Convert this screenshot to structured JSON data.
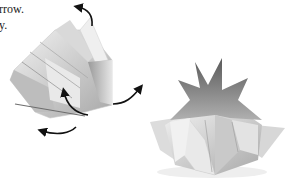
{
  "caption": {
    "lines": [
      "rrow.",
      "y."
    ]
  },
  "figures": {
    "left": {
      "description": "partially folded origami model with rotation arrows",
      "arrow_count": 4
    },
    "right": {
      "description": "completed eight-pointed star origami vase"
    }
  },
  "colors": {
    "background": "#ffffff",
    "text": "#1a1a1a",
    "arrow": "#111111",
    "paper_light": "#e8e8e8",
    "paper_mid": "#b5b5b5",
    "paper_dark": "#6a6a6a"
  }
}
